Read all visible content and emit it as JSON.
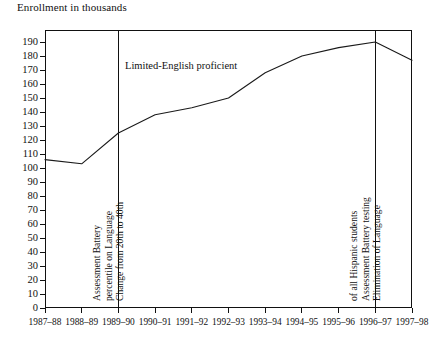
{
  "chart_data": {
    "type": "line",
    "title": "Enrollment in thousands",
    "xlabel": "",
    "ylabel": "Enrollment in thousands",
    "ylim": [
      0,
      190
    ],
    "ytick_step": 10,
    "grid": false,
    "legend": "none",
    "categories": [
      "1987–88",
      "1988–89",
      "1989–90",
      "1990–91",
      "1991–92",
      "1992–93",
      "1993–94",
      "1994–95",
      "1995–96",
      "1996–97",
      "1997–98"
    ],
    "yticks": [
      0,
      10,
      20,
      30,
      40,
      50,
      60,
      70,
      80,
      90,
      100,
      110,
      120,
      130,
      140,
      150,
      160,
      170,
      180,
      190
    ],
    "series": [
      {
        "name": "Limited-English proficient",
        "values": [
          106,
          103,
          125,
          138,
          143,
          150,
          168,
          180,
          186,
          190,
          177
        ],
        "color": "#1a1a1a"
      }
    ],
    "series_label": "Limited-English proficient",
    "annotations": [
      {
        "name": "change-percentile",
        "at_category": "1989–90",
        "orientation": "vertical",
        "lines": [
          "Change from 20th to 40th",
          "percentile on Language",
          "Assessment Battery"
        ]
      },
      {
        "name": "elimination-lab-testing",
        "at_category": "1996–97",
        "orientation": "vertical",
        "lines": [
          "Elimination of Language",
          "Assessment Battery testing",
          "of all Hispanic students"
        ]
      }
    ],
    "dividers": [
      "1989–90",
      "1996–97"
    ]
  },
  "colors": {
    "axis": "#111111",
    "line": "#1a1a1a",
    "background": "#ffffff",
    "text": "#111111"
  }
}
